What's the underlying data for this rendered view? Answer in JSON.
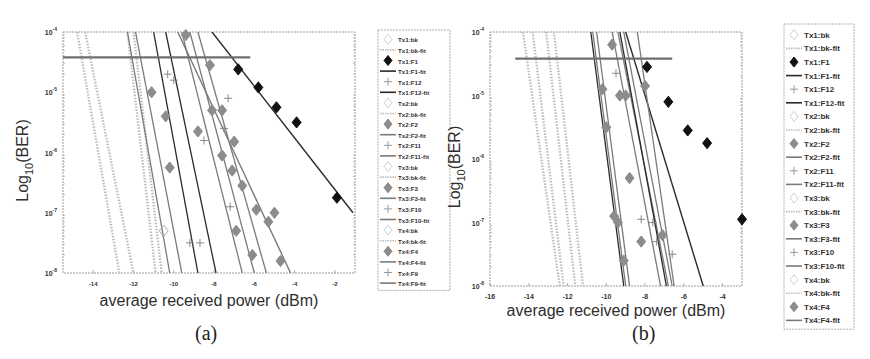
{
  "chart_data": [
    {
      "panel": "(a)",
      "type": "line",
      "title": "",
      "xlabel": "average received power (dBm)",
      "ylabel": "Log10(BER)",
      "ylabel_main": "Log",
      "ylabel_sub": "10",
      "ylabel_tail": "(BER)",
      "xlim": [
        -15.5,
        -1
      ],
      "ylim_log10": [
        -8,
        -4
      ],
      "xticks": [
        -14,
        -12,
        -10,
        -8,
        -6,
        -4,
        -2
      ],
      "yticks": [
        {
          "exp": -4,
          "label": "10",
          "sup": "-4"
        },
        {
          "exp": -5,
          "label": "10",
          "sup": "-5"
        },
        {
          "exp": -6,
          "label": "10",
          "sup": "-6"
        },
        {
          "exp": -7,
          "label": "10",
          "sup": "-7"
        },
        {
          "exp": -8,
          "label": "10",
          "sup": "-8"
        }
      ],
      "grid": false,
      "legend_position": "right-outside",
      "threshold": {
        "log10_ber": -4.42,
        "x_from": -15.5,
        "x_to": -6.2
      },
      "series": [
        {
          "name": "Tx1:F1",
          "marker": "diamond-filled-black",
          "points": [
            [
              -6.8,
              -4.62
            ],
            [
              -5.8,
              -4.92
            ],
            [
              -4.9,
              -5.25
            ],
            [
              -3.9,
              -5.5
            ],
            [
              -1.9,
              -6.75
            ]
          ]
        },
        {
          "name": "Tx1:F1-fit",
          "style": "line-dark",
          "x": [
            -8.1,
            -1.1
          ],
          "log10_ber": [
            -4.0,
            -7.0
          ]
        },
        {
          "name": "Tx2:F2",
          "marker": "diamond-filled-gray",
          "points": [
            [
              -10.4,
              -5.4
            ],
            [
              -8.8,
              -5.65
            ],
            [
              -7.1,
              -6.3
            ],
            [
              -5.9,
              -6.95
            ],
            [
              -5.0,
              -7.0
            ]
          ]
        },
        {
          "name": "Tx2:F2-fit",
          "style": "line-gray",
          "x": [
            -9.8,
            -4.2
          ],
          "log10_ber": [
            -4.0,
            -8.0
          ]
        },
        {
          "name": "Tx3:F3",
          "marker": "diamond-filled-gray",
          "points": [
            [
              -9.4,
              -4.05
            ],
            [
              -8.2,
              -4.55
            ],
            [
              -7.6,
              -5.3
            ],
            [
              -7.6,
              -6.05
            ],
            [
              -6.9,
              -7.3
            ],
            [
              -6.1,
              -7.7
            ]
          ]
        },
        {
          "name": "Tx4:F4",
          "marker": "diamond-filled-gray",
          "points": [
            [
              -10.2,
              -6.25
            ],
            [
              -11.1,
              -5.0
            ],
            [
              -8.1,
              -5.3
            ],
            [
              -7.0,
              -5.82
            ],
            [
              -6.6,
              -6.55
            ],
            [
              -5.3,
              -7.15
            ],
            [
              -4.7,
              -7.8
            ]
          ]
        },
        {
          "name": "Tx1:F12",
          "marker": "plus",
          "points": [
            [
              -10.0,
              -4.8
            ],
            [
              -9.2,
              -7.5
            ],
            [
              -8.7,
              -7.5
            ],
            [
              -7.3,
              -5.1
            ]
          ]
        },
        {
          "name": "Tx2:F11",
          "marker": "plus",
          "points": [
            [
              -8.5,
              -5.8
            ],
            [
              -7.5,
              -5.6
            ]
          ]
        },
        {
          "name": "Tx3:F10",
          "marker": "plus",
          "points": [
            [
              -7.2,
              -6.9
            ]
          ]
        },
        {
          "name": "Tx4:F9",
          "marker": "plus",
          "points": [
            [
              -10.3,
              -4.7
            ]
          ]
        },
        {
          "name": "Tx1:bk",
          "marker": "diamond-open",
          "points": [
            [
              -10.5,
              -7.3
            ]
          ]
        },
        {
          "name": "back-to-back fits",
          "style": "dotted-light",
          "x_at_top": [
            -14.8,
            -14.4,
            -12.3,
            -12.0
          ],
          "x_at_bottom": [
            -12.7,
            -12.0,
            -10.9,
            -10.6
          ]
        }
      ],
      "legend": [
        "Tx1:bk",
        "Tx1:bk-fit",
        "Tx1:F1",
        "Tx1:F1-fit",
        "Tx1:F12",
        "Tx1:F12-fit",
        "Tx2:bk",
        "Tx2:bk-fit",
        "Tx2:F2",
        "Tx2:F2-fit",
        "Tx2:F11",
        "Tx2:F11-fit",
        "Tx3:bk",
        "Tx3:bk-fit",
        "Tx3:F3",
        "Tx3:F3-fit",
        "Tx3:F10",
        "Tx3:F10-fit",
        "Tx4:bk",
        "Tx4:bk-fit",
        "Tx4:F4",
        "Tx4:F4-fit",
        "Tx4:F9",
        "Tx4:F9-fit"
      ],
      "caption": "(a)"
    },
    {
      "panel": "(b)",
      "type": "line",
      "title": "",
      "xlabel": "average received power (dBm)",
      "ylabel": "Log10(BER)",
      "ylabel_main": "Log",
      "ylabel_sub": "10",
      "ylabel_tail": "(BER)",
      "xlim": [
        -16,
        -3
      ],
      "ylim_log10": [
        -8,
        -4
      ],
      "xticks": [
        -16,
        -14,
        -12,
        -10,
        -8,
        -6,
        -4
      ],
      "yticks": [
        {
          "exp": -4,
          "label": "10",
          "sup": "-4"
        },
        {
          "exp": -5,
          "label": "10",
          "sup": "-5"
        },
        {
          "exp": -6,
          "label": "10",
          "sup": "-6"
        },
        {
          "exp": -7,
          "label": "10",
          "sup": "-7"
        },
        {
          "exp": -8,
          "label": "10",
          "sup": "-8"
        }
      ],
      "grid": false,
      "legend_position": "right-outside",
      "threshold": {
        "log10_ber": -4.42,
        "x_from": -14.7,
        "x_to": -6.6
      },
      "series": [
        {
          "name": "Tx1:F1",
          "marker": "diamond-filled-black",
          "points": [
            [
              -7.9,
              -4.55
            ],
            [
              -6.8,
              -5.1
            ],
            [
              -5.8,
              -5.55
            ],
            [
              -4.8,
              -5.75
            ],
            [
              -3.0,
              -6.95
            ]
          ]
        },
        {
          "name": "Tx1:F1-fit",
          "style": "line-dark",
          "x": [
            -9.0,
            -5.0
          ],
          "log10_ber": [
            -4.0,
            -8.0
          ]
        },
        {
          "name": "Tx2:F2",
          "marker": "diamond-filled-gray",
          "points": [
            [
              -9.0,
              -5.0
            ],
            [
              -8.8,
              -6.3
            ],
            [
              -8.2,
              -7.3
            ],
            [
              -9.6,
              -6.9
            ],
            [
              -8.0,
              -4.85
            ]
          ]
        },
        {
          "name": "Tx3:F3",
          "marker": "diamond-filled-gray",
          "points": [
            [
              -10.2,
              -4.9
            ],
            [
              -10.0,
              -5.5
            ],
            [
              -9.4,
              -7.0
            ],
            [
              -9.1,
              -7.6
            ]
          ]
        },
        {
          "name": "Tx4:F4",
          "marker": "diamond-filled-gray",
          "points": [
            [
              -9.7,
              -4.2
            ],
            [
              -9.3,
              -5.0
            ],
            [
              -7.1,
              -7.2
            ]
          ]
        },
        {
          "name": "Tx1:F12 / Tx2:F11 / Tx3:F10",
          "marker": "plus",
          "points": [
            [
              -9.5,
              -4.65
            ],
            [
              -8.2,
              -6.95
            ],
            [
              -7.4,
              -7.3
            ],
            [
              -6.6,
              -7.5
            ],
            [
              -7.6,
              -7.0
            ]
          ]
        },
        {
          "name": "fits",
          "style": "line-gray",
          "x_at_top": [
            -10.7,
            -10.5,
            -9.7,
            -9.4,
            -8.4
          ],
          "x_at_bottom": [
            -9.0,
            -8.8,
            -7.2,
            -6.8,
            -6.5
          ]
        },
        {
          "name": "back-to-back fits",
          "style": "dotted-light",
          "x_at_top": [
            -14.3,
            -13.8,
            -13.1,
            -12.7
          ],
          "x_at_bottom": [
            -12.4,
            -12.2,
            -11.6,
            -11.2
          ]
        }
      ],
      "legend": [
        "Tx1:bk",
        "Tx1:bk-fit",
        "Tx1:F1",
        "Tx1:F1-fit",
        "Tx1:F12",
        "Tx1:F12-fit",
        "Tx2:bk",
        "Tx2:bk-fit",
        "Tx2:F2",
        "Tx2:F2-fit",
        "Tx2:F11",
        "Tx2:F11-fit",
        "Tx3:bk",
        "Tx3:bk-fit",
        "Tx3:F3",
        "Tx3:F3-fit",
        "Tx3:F10",
        "Tx3:F10-fit",
        "Tx4:bk",
        "Tx4:bk-fit",
        "Tx4:F4",
        "Tx4:F4-fit"
      ],
      "caption": "(b)"
    }
  ],
  "colors": {
    "axis": "#9a9a9a",
    "dark_line": "#2a2a2a",
    "gray_line": "#7a7a7a",
    "gray_marker": "#8c8c8c",
    "black_marker": "#111111",
    "light_dotted": "#bdbdbd",
    "threshold": "#6f6f6f",
    "text": "#333333"
  }
}
